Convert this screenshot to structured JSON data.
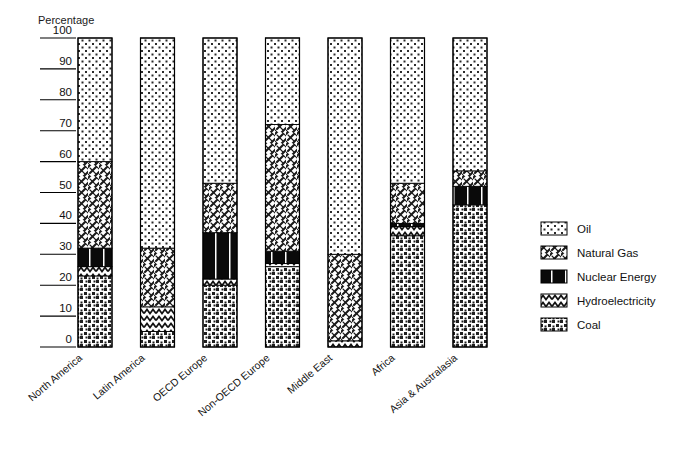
{
  "chart_data": {
    "type": "bar",
    "subtype": "stacked-percentage",
    "title": "",
    "ylabel": "Percentage",
    "xlabel": "",
    "ylim": [
      0,
      100
    ],
    "yticks": [
      0,
      10,
      20,
      30,
      40,
      50,
      60,
      70,
      80,
      90,
      100
    ],
    "ytick_labels": [
      "0",
      "10",
      "20",
      "30",
      "40",
      "50",
      "60",
      "70",
      "80",
      "90",
      "100"
    ],
    "grid": false,
    "legend_position": "right",
    "stack_order_bottom_to_top": [
      "Coal",
      "Hydroelectricity",
      "Nuclear Energy",
      "Natural Gas",
      "Oil"
    ],
    "categories": [
      "North America",
      "Latin America",
      "OECD Europe",
      "Non-OECD Europe",
      "Middle East",
      "Africa",
      "Asia & Australasia"
    ],
    "series": [
      {
        "name": "Coal",
        "pattern": "coal-speckle",
        "values": [
          23,
          5,
          20,
          26,
          0,
          36,
          46
        ]
      },
      {
        "name": "Hydroelectricity",
        "pattern": "hydro-wave",
        "values": [
          3,
          8,
          2,
          1,
          2,
          3,
          0
        ]
      },
      {
        "name": "Nuclear Energy",
        "pattern": "nuclear-solid",
        "values": [
          6,
          0,
          15,
          4,
          0,
          1,
          6
        ]
      },
      {
        "name": "Natural Gas",
        "pattern": "gas-hatch",
        "values": [
          28,
          19,
          16,
          41,
          28,
          13,
          5
        ]
      },
      {
        "name": "Oil",
        "pattern": "oil-dots",
        "values": [
          40,
          68,
          47,
          28,
          70,
          47,
          43
        ]
      }
    ],
    "legend_entries": [
      {
        "label": "Oil",
        "pattern": "oil-dots"
      },
      {
        "label": "Natural Gas",
        "pattern": "gas-hatch"
      },
      {
        "label": "Nuclear Energy",
        "pattern": "nuclear-solid"
      },
      {
        "label": "Hydroelectricity",
        "pattern": "hydro-wave"
      },
      {
        "label": "Coal",
        "pattern": "coal-speckle"
      }
    ],
    "colors": {
      "ink": "#000000",
      "paper": "#ffffff",
      "nuclear_fill": "#0a0a0a"
    }
  }
}
